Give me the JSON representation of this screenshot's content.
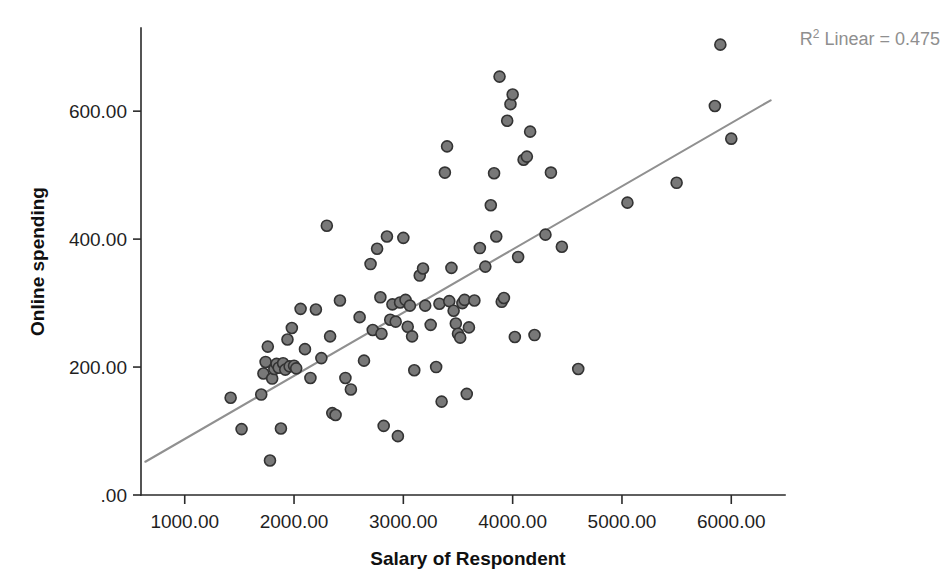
{
  "chart_data": {
    "type": "scatter",
    "title": "",
    "xlabel": "Salary of Respondent",
    "ylabel": "Online spending",
    "xlim": [
      600,
      6400
    ],
    "ylim": [
      0,
      730
    ],
    "grid": false,
    "legend": null,
    "x_ticks": [
      "1000.00",
      "2000.00",
      "3000.00",
      "4000.00",
      "5000.00",
      "6000.00"
    ],
    "x_tick_values": [
      1000,
      2000,
      3000,
      4000,
      5000,
      6000
    ],
    "y_ticks": [
      ".00",
      "200.00",
      "400.00",
      "600.00"
    ],
    "y_tick_values": [
      0,
      200,
      400,
      600
    ],
    "annotations": [
      {
        "name": "r-squared-annotation",
        "prefix": "R",
        "superscript": "2",
        "suffix": " Linear = 0.475",
        "full_text": "R² Linear = 0.475",
        "value": 0.475,
        "position": "top-right",
        "color": "#8f8f8f"
      }
    ],
    "series": [
      {
        "name": "Online spending vs Salary",
        "marker": "filled-circle",
        "marker_fill": "#787878",
        "marker_edge": "#333333",
        "marker_size": 11,
        "points": [
          [
            1420,
            152
          ],
          [
            1520,
            103
          ],
          [
            1700,
            157
          ],
          [
            1720,
            190
          ],
          [
            1740,
            208
          ],
          [
            1760,
            232
          ],
          [
            1780,
            54
          ],
          [
            1800,
            182
          ],
          [
            1820,
            197
          ],
          [
            1840,
            205
          ],
          [
            1860,
            199
          ],
          [
            1880,
            104
          ],
          [
            1900,
            206
          ],
          [
            1920,
            196
          ],
          [
            1940,
            243
          ],
          [
            1960,
            201
          ],
          [
            1980,
            261
          ],
          [
            2000,
            202
          ],
          [
            2020,
            198
          ],
          [
            2060,
            291
          ],
          [
            2100,
            228
          ],
          [
            2150,
            183
          ],
          [
            2200,
            290
          ],
          [
            2250,
            214
          ],
          [
            2300,
            421
          ],
          [
            2330,
            248
          ],
          [
            2350,
            128
          ],
          [
            2380,
            125
          ],
          [
            2420,
            304
          ],
          [
            2470,
            183
          ],
          [
            2520,
            165
          ],
          [
            2600,
            278
          ],
          [
            2640,
            210
          ],
          [
            2700,
            361
          ],
          [
            2720,
            258
          ],
          [
            2760,
            385
          ],
          [
            2790,
            309
          ],
          [
            2800,
            252
          ],
          [
            2820,
            108
          ],
          [
            2850,
            404
          ],
          [
            2880,
            274
          ],
          [
            2900,
            298
          ],
          [
            2930,
            271
          ],
          [
            2950,
            92
          ],
          [
            2970,
            301
          ],
          [
            3000,
            402
          ],
          [
            3020,
            305
          ],
          [
            3040,
            263
          ],
          [
            3060,
            296
          ],
          [
            3080,
            248
          ],
          [
            3100,
            195
          ],
          [
            3150,
            343
          ],
          [
            3180,
            354
          ],
          [
            3200,
            296
          ],
          [
            3250,
            266
          ],
          [
            3300,
            200
          ],
          [
            3330,
            299
          ],
          [
            3350,
            146
          ],
          [
            3380,
            504
          ],
          [
            3400,
            545
          ],
          [
            3420,
            303
          ],
          [
            3440,
            355
          ],
          [
            3460,
            288
          ],
          [
            3480,
            268
          ],
          [
            3500,
            252
          ],
          [
            3520,
            246
          ],
          [
            3540,
            300
          ],
          [
            3560,
            305
          ],
          [
            3580,
            158
          ],
          [
            3600,
            262
          ],
          [
            3650,
            304
          ],
          [
            3700,
            386
          ],
          [
            3750,
            357
          ],
          [
            3800,
            453
          ],
          [
            3830,
            503
          ],
          [
            3850,
            404
          ],
          [
            3880,
            654
          ],
          [
            3900,
            302
          ],
          [
            3920,
            308
          ],
          [
            3950,
            585
          ],
          [
            3980,
            611
          ],
          [
            4000,
            626
          ],
          [
            4020,
            247
          ],
          [
            4050,
            372
          ],
          [
            4100,
            524
          ],
          [
            4130,
            529
          ],
          [
            4160,
            568
          ],
          [
            4200,
            250
          ],
          [
            4300,
            407
          ],
          [
            4350,
            504
          ],
          [
            4450,
            388
          ],
          [
            4600,
            197
          ],
          [
            5050,
            457
          ],
          [
            5500,
            488
          ],
          [
            5850,
            608
          ],
          [
            5900,
            704
          ],
          [
            6000,
            557
          ]
        ]
      }
    ],
    "fit_line": {
      "name": "linear-regression-line",
      "color": "#909090",
      "x_start": 640,
      "y_start": 52,
      "x_end": 6360,
      "y_end": 617
    }
  }
}
